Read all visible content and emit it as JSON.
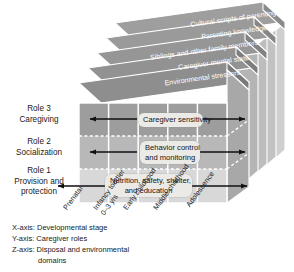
{
  "figure": {
    "type": "3d-cube-diagram",
    "title_present": false
  },
  "z_slabs": [
    {
      "label": "Cultural scripts of parenting"
    },
    {
      "label": "Parenting knowledge"
    },
    {
      "label": "Siblings and other family members"
    },
    {
      "label": "Caregiver mental state"
    },
    {
      "label": "Environmental stressors"
    }
  ],
  "y_roles": [
    {
      "number": "Role 3",
      "name": "Caregiving"
    },
    {
      "number": "Role 2",
      "name": "Socialization"
    },
    {
      "number": "Role 1",
      "name": "Provision and",
      "name2": "protection"
    }
  ],
  "callouts": [
    {
      "line1": "Caregiver sensitivity",
      "line2": ""
    },
    {
      "line1": "Behavior control",
      "line2": "and monitoring"
    },
    {
      "line1": "Nutrition, safety, shelter,",
      "line2": "and education"
    }
  ],
  "x_stages": [
    {
      "line1": "Prenatal",
      "line2": ""
    },
    {
      "line1": "Infancy toddler",
      "line2": "0–3 yrs"
    },
    {
      "line1": "Early childhood",
      "line2": ""
    },
    {
      "line1": "Middle childhood",
      "line2": ""
    },
    {
      "line1": "Adolescence",
      "line2": ""
    }
  ],
  "legend": {
    "x_axis": "X-axis: Developmental stage",
    "y_axis": "Y-axis: Caregiver roles",
    "z_axis": "Z-axis: Disposal and environmental",
    "z_axis_cont": "domains"
  },
  "colors": {
    "slab_top": "#9a9a9a",
    "slab_front": "#8e8e8e",
    "row_dark": "#9d9d9d",
    "row_mid": "#b6b6b6",
    "row_light": "#d6d6d6",
    "side_dark": "#7e7e7e",
    "side_mid": "#a3a3a3",
    "side_light": "#c9c9c9",
    "callout_bg": "#eceae6",
    "text": "#1a1a1a",
    "slab_text": "#ffffff",
    "arrow": "#111111"
  }
}
